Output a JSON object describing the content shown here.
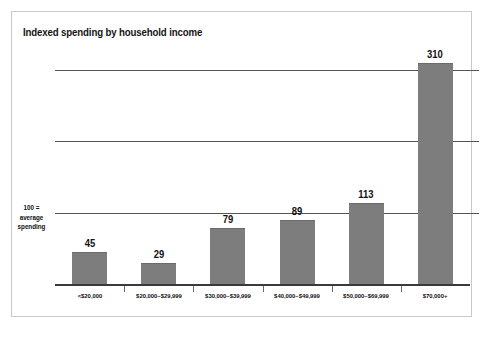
{
  "chart_data": {
    "type": "bar",
    "title": "Indexed spending by household income",
    "categories": [
      "<$20,000",
      "$20,000–$29,999",
      "$30,000–$39,999",
      "$40,000–$49,999",
      "$50,000–$69,999",
      "$70,000+"
    ],
    "values": [
      45,
      29,
      79,
      89,
      113,
      310
    ],
    "xlabel": "",
    "ylabel": "",
    "ylim": [
      0,
      330
    ],
    "gridlines": [
      100,
      200,
      300
    ],
    "grid": true,
    "legend": false,
    "annotations": {
      "baseline_note_line1": "100 =",
      "baseline_note_line2": "average",
      "baseline_note_line3": "spending"
    },
    "colors": {
      "bar_fill": "#7d7d7d",
      "bar_edge": "#6a6a6a",
      "gridline": "#555555",
      "axis": "#3a3a3a",
      "text": "#111111",
      "frame": "#c9c9c9",
      "background": "#ffffff"
    }
  }
}
